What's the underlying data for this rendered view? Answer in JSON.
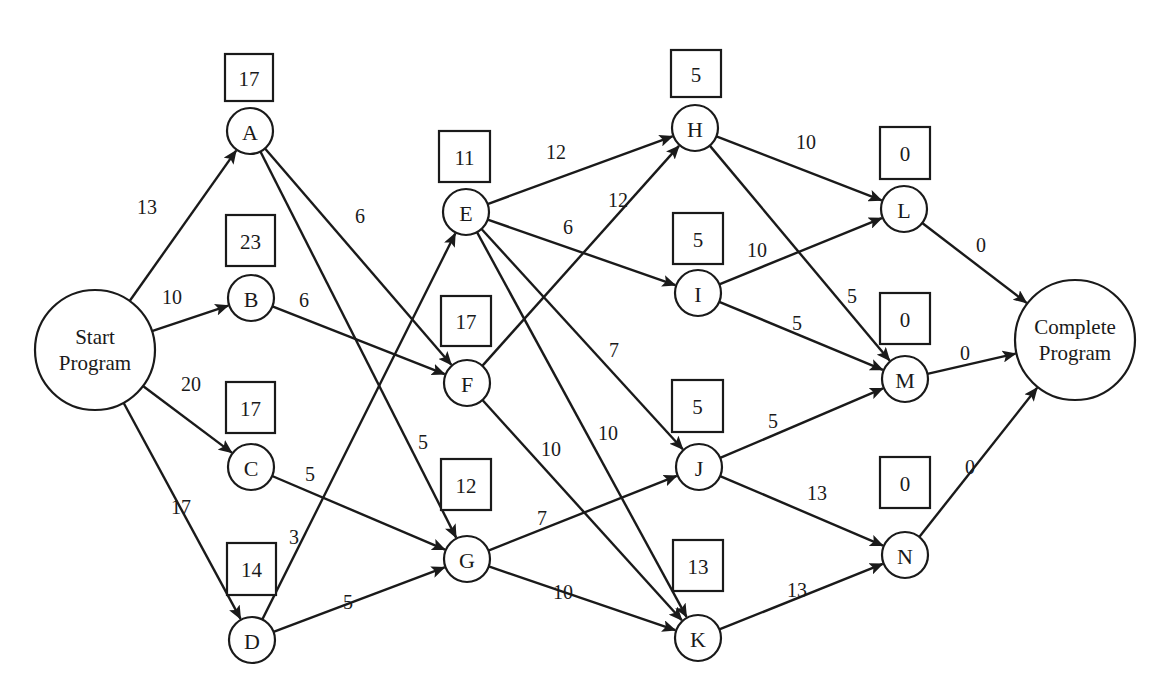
{
  "diagram": {
    "type": "network-project-schedule",
    "nodes": [
      {
        "id": "start",
        "label_lines": [
          "Start",
          "Program"
        ],
        "x": 95,
        "y": 350,
        "r": 60
      },
      {
        "id": "A",
        "label": "A",
        "x": 250,
        "y": 131,
        "r": 23,
        "slack": "17",
        "box": [
          225,
          54,
          48,
          47
        ]
      },
      {
        "id": "B",
        "label": "B",
        "x": 251,
        "y": 298,
        "r": 23,
        "slack": "23",
        "box": [
          226,
          215,
          49,
          51
        ]
      },
      {
        "id": "C",
        "label": "C",
        "x": 251,
        "y": 467,
        "r": 23,
        "slack": "17",
        "box": [
          226,
          382,
          49,
          51
        ]
      },
      {
        "id": "D",
        "label": "D",
        "x": 252,
        "y": 640,
        "r": 23,
        "slack": "14",
        "box": [
          227,
          543,
          49,
          52
        ]
      },
      {
        "id": "E",
        "label": "E",
        "x": 466,
        "y": 212,
        "r": 23,
        "slack": "11",
        "box": [
          439,
          131,
          51,
          51
        ]
      },
      {
        "id": "F",
        "label": "F",
        "x": 467,
        "y": 383,
        "r": 23,
        "slack": "17",
        "box": [
          441,
          296,
          50,
          50
        ]
      },
      {
        "id": "G",
        "label": "G",
        "x": 467,
        "y": 559,
        "r": 23,
        "slack": "12",
        "box": [
          441,
          459,
          50,
          51
        ]
      },
      {
        "id": "H",
        "label": "H",
        "x": 695,
        "y": 128,
        "r": 23,
        "slack": "5",
        "box": [
          671,
          50,
          50,
          47
        ]
      },
      {
        "id": "I",
        "label": "I",
        "x": 698,
        "y": 293,
        "r": 23,
        "slack": "5",
        "box": [
          673,
          213,
          50,
          51
        ]
      },
      {
        "id": "J",
        "label": "J",
        "x": 699,
        "y": 467,
        "r": 23,
        "slack": "5",
        "box": [
          672,
          380,
          51,
          52
        ]
      },
      {
        "id": "K",
        "label": "K",
        "x": 698,
        "y": 638,
        "r": 23,
        "slack": "13",
        "box": [
          673,
          540,
          50,
          51
        ]
      },
      {
        "id": "L",
        "label": "L",
        "x": 904,
        "y": 209,
        "r": 23,
        "slack": "0",
        "box": [
          880,
          127,
          50,
          52
        ]
      },
      {
        "id": "M",
        "label": "M",
        "x": 905,
        "y": 379,
        "r": 23,
        "slack": "0",
        "box": [
          880,
          293,
          50,
          51
        ]
      },
      {
        "id": "N",
        "label": "N",
        "x": 905,
        "y": 555,
        "r": 23,
        "slack": "0",
        "box": [
          880,
          457,
          50,
          51
        ]
      },
      {
        "id": "complete",
        "label_lines": [
          "Complete",
          "Program"
        ],
        "x": 1075,
        "y": 340,
        "r": 60
      }
    ],
    "edges": [
      {
        "from": "start",
        "to": "A",
        "weight": "13",
        "lx": 147,
        "ly": 207
      },
      {
        "from": "start",
        "to": "B",
        "weight": "10",
        "lx": 172,
        "ly": 297
      },
      {
        "from": "start",
        "to": "C",
        "weight": "20",
        "lx": 191,
        "ly": 384
      },
      {
        "from": "start",
        "to": "D",
        "weight": "17",
        "lx": 181,
        "ly": 507
      },
      {
        "from": "A",
        "to": "F",
        "weight": "6",
        "lx": 360,
        "ly": 216
      },
      {
        "from": "A",
        "to": "G",
        "weight": "5",
        "lx": 423,
        "ly": 442
      },
      {
        "from": "B",
        "to": "F",
        "weight": "6",
        "lx": 304,
        "ly": 300
      },
      {
        "from": "C",
        "to": "G",
        "weight": "5",
        "lx": 310,
        "ly": 474
      },
      {
        "from": "D",
        "to": "E",
        "weight": "3",
        "lx": 294,
        "ly": 537
      },
      {
        "from": "D",
        "to": "G",
        "weight": "5",
        "lx": 348,
        "ly": 602
      },
      {
        "from": "E",
        "to": "H",
        "weight": "12",
        "lx": 556,
        "ly": 152
      },
      {
        "from": "E",
        "to": "I",
        "weight": "6",
        "lx": 568,
        "ly": 227
      },
      {
        "from": "E",
        "to": "J",
        "weight": "7",
        "lx": 614,
        "ly": 350
      },
      {
        "from": "E",
        "to": "K",
        "weight": "10",
        "lx": 608,
        "ly": 433
      },
      {
        "from": "F",
        "to": "H",
        "weight": "12",
        "lx": 618,
        "ly": 200
      },
      {
        "from": "F",
        "to": "K",
        "weight": "10",
        "lx": 551,
        "ly": 449
      },
      {
        "from": "G",
        "to": "J",
        "weight": "7",
        "lx": 542,
        "ly": 518
      },
      {
        "from": "G",
        "to": "K",
        "weight": "10",
        "lx": 563,
        "ly": 592
      },
      {
        "from": "H",
        "to": "L",
        "weight": "10",
        "lx": 806,
        "ly": 142
      },
      {
        "from": "H",
        "to": "M",
        "weight": "5",
        "lx": 852,
        "ly": 296
      },
      {
        "from": "I",
        "to": "L",
        "weight": "10",
        "lx": 757,
        "ly": 250
      },
      {
        "from": "I",
        "to": "M",
        "weight": "5",
        "lx": 797,
        "ly": 323
      },
      {
        "from": "J",
        "to": "M",
        "weight": "5",
        "lx": 773,
        "ly": 421
      },
      {
        "from": "J",
        "to": "N",
        "weight": "13",
        "lx": 817,
        "ly": 493
      },
      {
        "from": "K",
        "to": "N",
        "weight": "13",
        "lx": 797,
        "ly": 590
      },
      {
        "from": "L",
        "to": "complete",
        "weight": "0",
        "lx": 981,
        "ly": 245
      },
      {
        "from": "M",
        "to": "complete",
        "weight": "0",
        "lx": 965,
        "ly": 353
      },
      {
        "from": "N",
        "to": "complete",
        "weight": "0",
        "lx": 970,
        "ly": 467
      }
    ]
  },
  "colors": {
    "ink": "#1a1a1a",
    "background": "#ffffff"
  }
}
